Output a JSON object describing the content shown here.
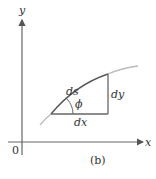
{
  "figure": {
    "caption": "(b)",
    "axes": {
      "x_label": "x",
      "y_label": "y",
      "origin_label": "0"
    },
    "triangle": {
      "hypotenuse_label": "ds",
      "vertical_label": "dy",
      "horizontal_label": "dx",
      "angle_label": "ϕ"
    },
    "colors": {
      "axis": "#666666",
      "curve_light": "#bbbbbb",
      "curve_dark": "#555555",
      "triangle": "#666666",
      "text": "#333333"
    }
  }
}
